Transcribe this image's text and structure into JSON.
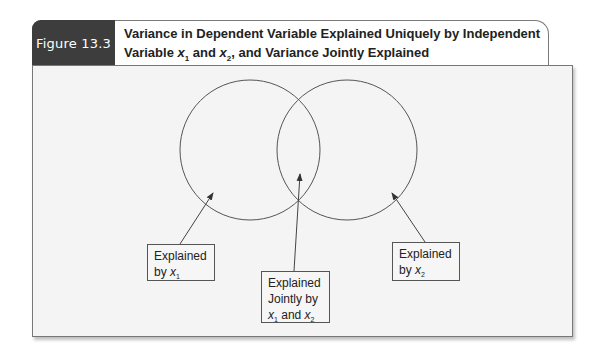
{
  "figure": {
    "label": "Figure 13.3",
    "title_line1": "Variance in Dependent Variable Explained Uniquely by Independent",
    "title_line2_prefix": "Variable ",
    "title_var1": "x",
    "title_sub1": "1",
    "title_mid": " and ",
    "title_var2": "x",
    "title_sub2": "2",
    "title_suffix": ", and Variance Jointly Explained",
    "accent_tab_color": "#3d3d3d"
  },
  "diagram": {
    "type": "venn",
    "circles": [
      {
        "name": "x1",
        "cx": 250,
        "cy": 150,
        "r": 70
      },
      {
        "name": "x2",
        "cx": 347,
        "cy": 150,
        "r": 70
      }
    ],
    "labels": {
      "left": {
        "line1": "Explained",
        "line2_prefix": "by ",
        "var": "x",
        "sub": "1"
      },
      "joint": {
        "line1": "Explained",
        "line2": "Jointly by",
        "var1": "x",
        "sub1": "1",
        "mid": " and ",
        "var2": "x",
        "sub2": "2"
      },
      "right": {
        "line1": "Explained",
        "line2_prefix": "by ",
        "var": "x",
        "sub": "2"
      }
    }
  }
}
